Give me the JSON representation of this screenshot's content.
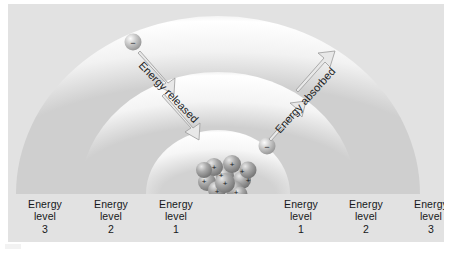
{
  "figure": {
    "background_color": "#e2e2e2",
    "panel_color": "#e2e2e2"
  },
  "nucleus": {
    "name": "nucleus",
    "charge_symbol": "+",
    "charge_count": 9,
    "color": "#8c8c8c"
  },
  "electrons": [
    {
      "name": "electron-outer-left",
      "charge_symbol": "−",
      "position": "energy level 3, left"
    },
    {
      "name": "electron-inner-right",
      "charge_symbol": "−",
      "position": "energy level 1, right"
    }
  ],
  "annotations": {
    "released": {
      "label": "Energy released",
      "direction": "inward",
      "arrow_count": 2
    },
    "absorbed": {
      "label": "Energy absorbed",
      "direction": "outward",
      "arrow_count": 2
    }
  },
  "levels": {
    "word_energy": "Energy",
    "word_level": "level",
    "items": [
      {
        "side": "left",
        "number": "3",
        "x": 37
      },
      {
        "side": "left",
        "number": "2",
        "x": 103
      },
      {
        "side": "left",
        "number": "1",
        "x": 168
      },
      {
        "side": "right",
        "number": "1",
        "x": 293
      },
      {
        "side": "right",
        "number": "2",
        "x": 358
      },
      {
        "side": "right",
        "number": "3",
        "x": 423
      }
    ]
  },
  "colors": {
    "shell_light": "#ffffff",
    "shell_shadow": "#c9c9c9",
    "arrow_fill": "#e8e8e8",
    "arrow_stroke": "#9a9a9a",
    "text": "#16181a"
  }
}
